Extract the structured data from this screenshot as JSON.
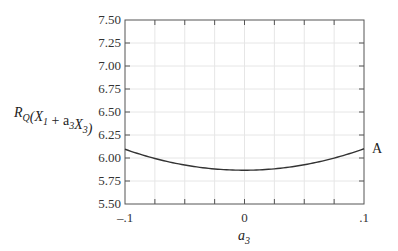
{
  "chart_data": {
    "type": "line",
    "title": "",
    "xlabel": "a3",
    "ylabel": "R_Q(X_1 + a_3 X_3)",
    "xlabel_parts": {
      "base": "a",
      "sub": "3"
    },
    "ylabel_parts": [
      {
        "text": "R",
        "sub": "Q"
      },
      {
        "text": "(X",
        "sub": "1"
      },
      {
        "text": " + a",
        "sub": "3"
      },
      {
        "text": "X",
        "sub": "3"
      },
      {
        "text": ")",
        "sub": ""
      }
    ],
    "xlim": [
      -0.1,
      0.1
    ],
    "ylim": [
      5.5,
      7.5
    ],
    "x_ticks": [
      -0.1,
      -0.075,
      -0.05,
      -0.025,
      0,
      0.025,
      0.05,
      0.075,
      0.1
    ],
    "x_tick_labels": [
      {
        "value": -0.1,
        "label": "–.1"
      },
      {
        "value": 0,
        "label": "0"
      },
      {
        "value": 0.1,
        "label": ".1"
      }
    ],
    "y_ticks": [
      5.5,
      5.75,
      6.0,
      6.25,
      6.5,
      6.75,
      7.0,
      7.25,
      7.5
    ],
    "y_tick_labels": [
      "5.50",
      "5.75",
      "6.00",
      "6.25",
      "6.50",
      "6.75",
      "7.00",
      "7.25",
      "7.50"
    ],
    "grid": true,
    "series": [
      {
        "name": "A",
        "color": "#333333",
        "x": [
          -0.1,
          -0.075,
          -0.05,
          -0.025,
          0,
          0.025,
          0.05,
          0.075,
          0.1
        ],
        "y": [
          6.09,
          6.0,
          5.93,
          5.88,
          5.86,
          5.88,
          5.93,
          6.0,
          6.1
        ]
      }
    ],
    "annotations": [
      {
        "text": "A",
        "at": "right end of curve"
      }
    ]
  }
}
